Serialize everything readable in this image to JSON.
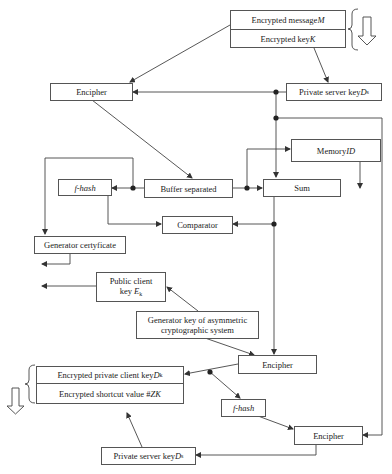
{
  "diagram": {
    "type": "flowchart",
    "topic": "encryption / certificate generation flow",
    "colors": {
      "line": "#333333",
      "box_border": "#555555",
      "background": "#ffffff"
    },
    "nodes": {
      "encrypted_message": {
        "label": "Encrypted message ",
        "var": "M"
      },
      "encrypted_key": {
        "label": "Encrypted key ",
        "var": "K"
      },
      "encipher_1": {
        "label": "Encipher"
      },
      "private_server_key_1": {
        "label": "Private server key ",
        "var": "D",
        "sub": "s"
      },
      "memory_id": {
        "label": "Memory ",
        "var": "ID"
      },
      "f_hash_1": {
        "label": "f-hash"
      },
      "buffer_separated": {
        "label": "Buffer separated"
      },
      "sum": {
        "label": "Sum"
      },
      "comparator": {
        "label": "Comparator"
      },
      "generator_certificate": {
        "label": "Generator certyficate"
      },
      "public_client_key": {
        "label_line1": "Public client",
        "label_line2": "key ",
        "var": "E",
        "sub": "k"
      },
      "generator_key": {
        "label_line1": "Generator key of asymmetric",
        "label_line2": "cryptographic system"
      },
      "encipher_2": {
        "label": "Encipher"
      },
      "encrypted_private_client_key": {
        "label": "Encrypted private client key ",
        "var": "D",
        "sub": "k"
      },
      "encrypted_shortcut_value": {
        "label": "Encrypted shortcut value #",
        "var": "ZK"
      },
      "f_hash_2": {
        "label": "f-hash"
      },
      "encipher_3": {
        "label": "Encipher"
      },
      "private_server_key_2": {
        "label": "Private server key ",
        "var": "D",
        "sub": "s"
      }
    },
    "edges": [
      [
        "encrypted_message",
        "encipher_1"
      ],
      [
        "encrypted_key",
        "private_server_key_1"
      ],
      [
        "private_server_key_1",
        "encipher_1"
      ],
      [
        "private_server_key_1",
        "sum"
      ],
      [
        "private_server_key_1",
        "encipher_3"
      ],
      [
        "encipher_1",
        "buffer_separated"
      ],
      [
        "buffer_separated",
        "f_hash_1"
      ],
      [
        "buffer_separated",
        "generator_certificate"
      ],
      [
        "buffer_separated",
        "memory_id"
      ],
      [
        "buffer_separated",
        "sum"
      ],
      [
        "f_hash_1",
        "comparator"
      ],
      [
        "sum",
        "comparator"
      ],
      [
        "sum",
        "encipher_2"
      ],
      [
        "generator_key",
        "public_client_key"
      ],
      [
        "generator_key",
        "encipher_2"
      ],
      [
        "encipher_2",
        "encrypted_private_client_key"
      ],
      [
        "encipher_2",
        "f_hash_2"
      ],
      [
        "f_hash_2",
        "encipher_3"
      ],
      [
        "encipher_3",
        "private_server_key_2"
      ],
      [
        "private_server_key_2",
        "encrypted_shortcut_value"
      ]
    ]
  }
}
